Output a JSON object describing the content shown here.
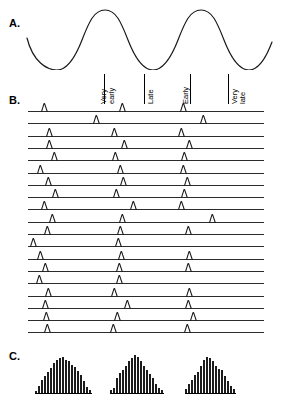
{
  "figure": {
    "panels": [
      {
        "letter": "A.",
        "name": "oscillation-trace"
      },
      {
        "letter": "B.",
        "name": "spike-raster"
      },
      {
        "letter": "C.",
        "name": "phase-histograms"
      }
    ]
  },
  "panel_a": {
    "letter": "A.",
    "description": "sinusoidal oscillation trace, three cycles",
    "stroke_color": "#1a1a1a",
    "cycles": 3
  },
  "phase_labels": [
    {
      "id": "very-early",
      "line1": "Very",
      "line2": "early",
      "x": 103
    },
    {
      "id": "late",
      "line1": "Late",
      "line2": "",
      "x": 143
    },
    {
      "id": "early",
      "line1": "Early",
      "line2": "",
      "x": 185
    },
    {
      "id": "very-late",
      "line1": "Very",
      "line2": "late",
      "x": 228
    }
  ],
  "panel_b": {
    "letter": "B.",
    "description": "spike raster, 19 trials with spikes at shifting oscillation phases",
    "trial_count": 19,
    "baseline_color": "#2b2b2b",
    "spike_color": "#1a1a1a",
    "trials": [
      [
        41,
        119,
        180
      ],
      [
        93,
        200
      ],
      [
        46,
        111,
        178
      ],
      [
        46,
        121,
        186
      ],
      [
        51,
        112,
        181
      ],
      [
        37,
        117,
        180
      ],
      [
        45,
        120,
        184
      ],
      [
        52,
        113,
        181
      ],
      [
        41,
        130,
        178
      ],
      [
        49,
        119,
        209
      ],
      [
        44,
        117,
        185
      ],
      [
        30,
        115
      ],
      [
        37,
        118,
        186
      ],
      [
        42,
        116,
        185
      ],
      [
        36,
        116
      ],
      [
        45,
        111,
        186
      ],
      [
        42,
        124,
        185
      ],
      [
        43,
        114,
        190
      ],
      [
        44,
        110,
        184
      ]
    ]
  },
  "panel_c": {
    "letter": "C.",
    "description": "three phase histograms of spike counts",
    "bar_color": "#1c1c1c",
    "histograms": [
      {
        "id": "histogram-1",
        "left": 35,
        "values": [
          2,
          7,
          12,
          16,
          20,
          24,
          28,
          31,
          33,
          34,
          31,
          30,
          27,
          25,
          21,
          17,
          11,
          6,
          3
        ]
      },
      {
        "id": "histogram-2",
        "left": 110,
        "values": [
          3,
          5,
          14,
          19,
          22,
          26,
          30,
          33,
          36,
          34,
          30,
          26,
          22,
          18,
          14,
          9,
          5,
          3
        ]
      },
      {
        "id": "histogram-3",
        "left": 185,
        "values": [
          4,
          9,
          12,
          17,
          20,
          26,
          31,
          34,
          33,
          30,
          26,
          23,
          22,
          16,
          11,
          7,
          4
        ]
      }
    ]
  },
  "chart_data": {
    "type": "line",
    "title": "",
    "xlabel": "",
    "ylabel": "",
    "series": [
      {
        "name": "oscillation",
        "panel": "A",
        "type": "line",
        "cycles": 3,
        "amplitude": 1.0,
        "phase_markers": [
          "Very early",
          "Late",
          "Early",
          "Very late"
        ]
      },
      {
        "name": "spike-raster",
        "panel": "B",
        "type": "scatter",
        "trials": 19,
        "spikes_per_trial": [
          3,
          2,
          3,
          3,
          3,
          3,
          3,
          3,
          3,
          3,
          3,
          2,
          3,
          3,
          2,
          3,
          3,
          3,
          3
        ]
      },
      {
        "name": "phase-histogram-1",
        "panel": "C",
        "type": "bar",
        "values": [
          2,
          7,
          12,
          16,
          20,
          24,
          28,
          31,
          33,
          34,
          31,
          30,
          27,
          25,
          21,
          17,
          11,
          6,
          3
        ]
      },
      {
        "name": "phase-histogram-2",
        "panel": "C",
        "type": "bar",
        "values": [
          3,
          5,
          14,
          19,
          22,
          26,
          30,
          33,
          36,
          34,
          30,
          26,
          22,
          18,
          14,
          9,
          5,
          3
        ]
      },
      {
        "name": "phase-histogram-3",
        "panel": "C",
        "type": "bar",
        "values": [
          4,
          9,
          12,
          17,
          20,
          26,
          31,
          34,
          33,
          30,
          26,
          23,
          22,
          16,
          11,
          7,
          4
        ]
      }
    ]
  }
}
